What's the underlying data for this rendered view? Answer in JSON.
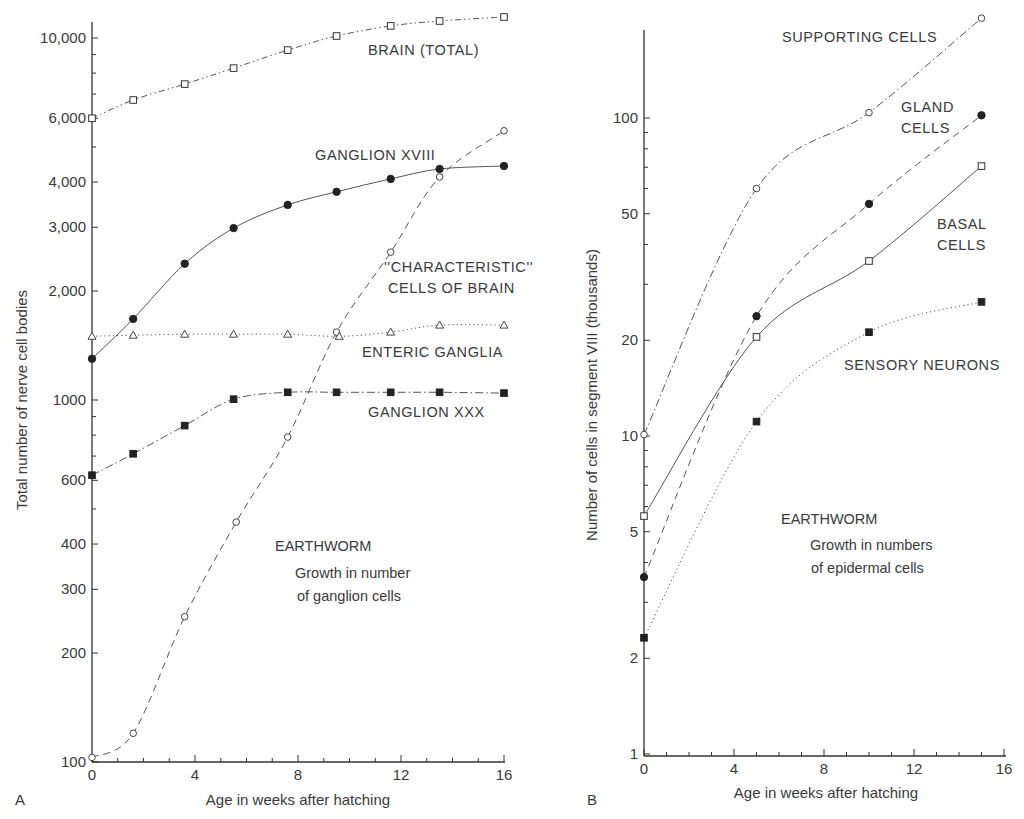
{
  "chart_data": [
    {
      "id": "A",
      "type": "line",
      "panel_letter": "A",
      "title": "",
      "xlabel": "Age in weeks after hatching",
      "ylabel": "Total number of nerve cell bodies",
      "yscale": "log",
      "xlim": [
        0,
        16
      ],
      "ylim": [
        100,
        12000
      ],
      "grid": false,
      "x_ticks": [
        0,
        4,
        8,
        12,
        16
      ],
      "x_tick_labels": [
        "0",
        "4",
        "8",
        "12",
        "16"
      ],
      "y_ticks": [
        100,
        200,
        300,
        400,
        600,
        1000,
        2000,
        3000,
        4000,
        6000,
        10000
      ],
      "y_tick_labels": [
        "100",
        "200",
        "300",
        "400",
        "600",
        "1000",
        "2,000",
        "3,000",
        "4,000",
        "6,000",
        "10,000"
      ],
      "annotations": [
        {
          "text": "EARTHWORM",
          "x": 275,
          "y": 551
        },
        {
          "text": "Growth in number",
          "x": 295,
          "y": 577
        },
        {
          "text": "of ganglion cells",
          "x": 297,
          "y": 600
        }
      ],
      "series": [
        {
          "name": "BRAIN (TOTAL)",
          "marker": "open-square",
          "line": "dash-dot-dot",
          "label_pos": [
            368,
            55
          ],
          "x": [
            0,
            1.6,
            3.6,
            5.5,
            7.6,
            9.5,
            11.6,
            13.5,
            16
          ],
          "values": [
            6000,
            6740,
            7460,
            8260,
            9260,
            10130,
            10800,
            11140,
            11430
          ]
        },
        {
          "name": "GANGLION XVIII",
          "marker": "filled-circle",
          "line": "solid",
          "label_pos": [
            315,
            160
          ],
          "x": [
            0,
            1.6,
            3.6,
            5.5,
            7.6,
            9.5,
            11.6,
            13.5,
            16
          ],
          "values": [
            1300,
            1675,
            2380,
            2985,
            3460,
            3760,
            4080,
            4345,
            4430
          ]
        },
        {
          "name": "\"CHARACTERISTIC\" CELLS OF BRAIN",
          "label_lines": [
            "''CHARACTERISTIC''",
            "CELLS OF BRAIN"
          ],
          "marker": "open-circle",
          "line": "dashed",
          "label_pos": [
            384,
            272
          ],
          "x": [
            0,
            1.6,
            3.6,
            5.6,
            7.6,
            9.5,
            11.6,
            13.5,
            16
          ],
          "values": [
            103,
            120,
            252,
            460,
            790,
            1540,
            2560,
            4130,
            5540
          ]
        },
        {
          "name": "ENTERIC GANGLIA",
          "marker": "open-triangle",
          "line": "dotted",
          "label_pos": [
            362,
            357
          ],
          "x": [
            0,
            1.6,
            3.6,
            5.5,
            7.6,
            9.6,
            11.6,
            13.5,
            16
          ],
          "values": [
            1500,
            1510,
            1520,
            1520,
            1520,
            1500,
            1540,
            1610,
            1610
          ]
        },
        {
          "name": "GANGLION XXX",
          "marker": "filled-square",
          "line": "dash-dot",
          "label_pos": [
            368,
            417
          ],
          "x": [
            0,
            1.6,
            3.6,
            5.5,
            7.6,
            9.5,
            11.6,
            13.5,
            16
          ],
          "values": [
            620,
            710,
            850,
            1005,
            1050,
            1050,
            1050,
            1050,
            1045
          ]
        }
      ]
    },
    {
      "id": "B",
      "type": "line",
      "panel_letter": "B",
      "title": "",
      "xlabel": "Age in weeks after hatching",
      "ylabel": "Number of cells in segment VIII (thousands)",
      "yscale": "log",
      "xlim": [
        0,
        16
      ],
      "ylim": [
        1,
        220
      ],
      "grid": false,
      "x_ticks": [
        0,
        4,
        8,
        12,
        16
      ],
      "x_tick_labels": [
        "0",
        "4",
        "8",
        "12",
        "16"
      ],
      "y_ticks": [
        1,
        2,
        5,
        10,
        20,
        50,
        100
      ],
      "y_tick_labels": [
        "1",
        "2",
        "5",
        "10",
        "20",
        "50",
        "100"
      ],
      "annotations": [
        {
          "text": "EARTHWORM",
          "x": 781,
          "y": 524
        },
        {
          "text": "Growth in numbers",
          "x": 810,
          "y": 550
        },
        {
          "text": "of epidermal cells",
          "x": 811,
          "y": 572
        }
      ],
      "series": [
        {
          "name": "SUPPORTING CELLS",
          "marker": "open-circle",
          "line": "dash-dot",
          "label_pos": [
            782,
            42
          ],
          "x": [
            0,
            5,
            10,
            15
          ],
          "values": [
            10.1,
            60,
            104,
            206
          ]
        },
        {
          "name": "GLAND CELLS",
          "label_lines": [
            "GLAND",
            "CELLS"
          ],
          "marker": "filled-circle",
          "line": "dashed",
          "label_pos": [
            901,
            112
          ],
          "x": [
            0,
            5,
            10,
            15
          ],
          "values": [
            3.6,
            23.8,
            53.7,
            102
          ]
        },
        {
          "name": "BASAL CELLS",
          "label_lines": [
            "BASAL",
            "CELLS"
          ],
          "marker": "open-square",
          "line": "solid",
          "label_pos": [
            937,
            229
          ],
          "x": [
            0,
            5,
            10,
            15
          ],
          "values": [
            5.6,
            20.5,
            35.5,
            70.6
          ]
        },
        {
          "name": "SENSORY NEURONS",
          "marker": "filled-square",
          "line": "dotted",
          "label_pos": [
            844,
            370
          ],
          "x": [
            0,
            5,
            10,
            15
          ],
          "values": [
            2.32,
            11.1,
            21.2,
            26.4
          ]
        }
      ]
    }
  ],
  "figure": {
    "panelA": {
      "letter": "A",
      "xlabel": "Age in weeks after hatching",
      "ylabel": "Total number of nerve cell bodies",
      "note_title": "EARTHWORM",
      "note_line1": "Growth in number",
      "note_line2": "of ganglion cells"
    },
    "panelB": {
      "letter": "B",
      "xlabel": "Age in weeks after hatching",
      "ylabel": "Number of cells in segment VIII (thousands)",
      "note_title": "EARTHWORM",
      "note_line1": "Growth in numbers",
      "note_line2": "of epidermal cells"
    }
  }
}
